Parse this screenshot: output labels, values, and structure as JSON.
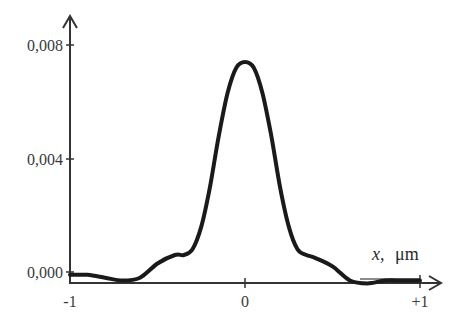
{
  "chart_data": {
    "type": "line",
    "title": "",
    "xlabel_var": "x,",
    "xlabel_unit": "μm",
    "ylabel": "",
    "xlim": [
      -1,
      1
    ],
    "ylim": [
      0,
      0.008
    ],
    "grid": false,
    "legend": null,
    "x_ticks": [
      "-1",
      "0",
      "+1"
    ],
    "y_ticks": [
      "0,000",
      "0,004",
      "0,008"
    ],
    "series": [
      {
        "name": "intensity profile",
        "x": [
          -1.0,
          -0.9,
          -0.8,
          -0.7,
          -0.6,
          -0.5,
          -0.4,
          -0.35,
          -0.3,
          -0.25,
          -0.2,
          -0.15,
          -0.1,
          -0.05,
          0.0,
          0.05,
          0.1,
          0.15,
          0.2,
          0.25,
          0.3,
          0.35,
          0.4,
          0.5,
          0.6,
          0.7,
          0.8,
          0.9,
          1.0
        ],
        "values": [
          -0.0001,
          -0.0001,
          -0.0002,
          -0.0003,
          -0.0002,
          0.0003,
          0.0006,
          0.0006,
          0.0008,
          0.0016,
          0.003,
          0.0048,
          0.0063,
          0.0072,
          0.0074,
          0.0072,
          0.0063,
          0.0048,
          0.003,
          0.0016,
          0.0008,
          0.0006,
          0.0005,
          0.0002,
          -0.0003,
          -0.0004,
          -0.0003,
          -0.0003,
          -0.0003
        ]
      }
    ]
  },
  "colors": {
    "line": "#1a1a1a",
    "axis": "#333333",
    "text": "#3a3a3a"
  }
}
